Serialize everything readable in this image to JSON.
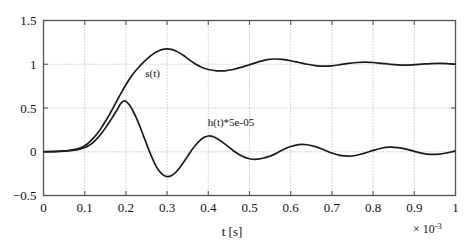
{
  "chart_data": {
    "type": "line",
    "title": "",
    "xlabel": "t [s]",
    "ylabel": "",
    "x_exponent_label": "× 10",
    "x_exponent_power": "-3",
    "xlim": [
      0,
      1
    ],
    "ylim": [
      -0.5,
      1.5
    ],
    "grid": true,
    "grid_style": "dotted",
    "legend_position": "inline-annotations",
    "xticks": [
      0,
      0.1,
      0.2,
      0.3,
      0.4,
      0.5,
      0.6,
      0.7,
      0.8,
      0.9,
      1
    ],
    "xticklabels": [
      "0",
      "0.1",
      "0.2",
      "0.3",
      "0.4",
      "0.5",
      "0.6",
      "0.7",
      "0.8",
      "0.9",
      "1"
    ],
    "yticks": [
      -0.5,
      0,
      0.5,
      1,
      1.5
    ],
    "yticklabels": [
      "−0.5",
      "0",
      "0.5",
      "1",
      "1.5"
    ],
    "annotations": [
      {
        "text": "s(t)",
        "x": 0.265,
        "y": 0.86
      },
      {
        "text": "h(t)*5e-05",
        "x": 0.455,
        "y": 0.3
      }
    ],
    "series": [
      {
        "name": "s(t)",
        "color": "#1a1a1a",
        "x": [
          0,
          0.02,
          0.04,
          0.06,
          0.08,
          0.09,
          0.1,
          0.11,
          0.12,
          0.13,
          0.14,
          0.15,
          0.16,
          0.17,
          0.18,
          0.19,
          0.2,
          0.21,
          0.22,
          0.23,
          0.24,
          0.25,
          0.26,
          0.27,
          0.28,
          0.29,
          0.3,
          0.31,
          0.32,
          0.33,
          0.34,
          0.35,
          0.36,
          0.37,
          0.38,
          0.39,
          0.4,
          0.42,
          0.44,
          0.46,
          0.48,
          0.5,
          0.52,
          0.54,
          0.56,
          0.58,
          0.6,
          0.62,
          0.64,
          0.66,
          0.68,
          0.7,
          0.72,
          0.74,
          0.76,
          0.78,
          0.8,
          0.82,
          0.84,
          0.86,
          0.88,
          0.9,
          0.92,
          0.94,
          0.96,
          0.98,
          1.0
        ],
        "y": [
          0,
          0.002,
          0.006,
          0.014,
          0.03,
          0.045,
          0.07,
          0.105,
          0.15,
          0.205,
          0.27,
          0.345,
          0.425,
          0.51,
          0.6,
          0.685,
          0.765,
          0.84,
          0.905,
          0.96,
          1.01,
          1.055,
          1.095,
          1.13,
          1.155,
          1.17,
          1.175,
          1.17,
          1.155,
          1.13,
          1.1,
          1.065,
          1.03,
          1.0,
          0.975,
          0.955,
          0.94,
          0.925,
          0.925,
          0.94,
          0.965,
          0.995,
          1.025,
          1.05,
          1.06,
          1.055,
          1.04,
          1.02,
          1.0,
          0.985,
          0.978,
          0.982,
          0.995,
          1.01,
          1.02,
          1.025,
          1.02,
          1.01,
          1.0,
          0.992,
          0.99,
          0.995,
          1.002,
          1.008,
          1.01,
          1.008,
          1.0
        ]
      },
      {
        "name": "h(t)*5e-05",
        "color": "#1a1a1a",
        "x": [
          0,
          0.02,
          0.04,
          0.06,
          0.08,
          0.09,
          0.1,
          0.11,
          0.12,
          0.13,
          0.14,
          0.15,
          0.16,
          0.17,
          0.18,
          0.185,
          0.19,
          0.195,
          0.2,
          0.21,
          0.22,
          0.23,
          0.24,
          0.25,
          0.26,
          0.27,
          0.28,
          0.29,
          0.3,
          0.31,
          0.32,
          0.33,
          0.34,
          0.35,
          0.36,
          0.37,
          0.38,
          0.39,
          0.4,
          0.41,
          0.42,
          0.44,
          0.46,
          0.48,
          0.5,
          0.52,
          0.54,
          0.55,
          0.56,
          0.58,
          0.6,
          0.62,
          0.64,
          0.66,
          0.68,
          0.7,
          0.72,
          0.74,
          0.76,
          0.78,
          0.8,
          0.82,
          0.84,
          0.86,
          0.88,
          0.9,
          0.92,
          0.94,
          0.96,
          0.98,
          1.0
        ],
        "y": [
          0,
          0.001,
          0.004,
          0.01,
          0.022,
          0.032,
          0.048,
          0.072,
          0.105,
          0.15,
          0.205,
          0.27,
          0.34,
          0.415,
          0.49,
          0.535,
          0.565,
          0.58,
          0.575,
          0.525,
          0.44,
          0.335,
          0.215,
          0.09,
          -0.03,
          -0.135,
          -0.215,
          -0.265,
          -0.285,
          -0.275,
          -0.24,
          -0.185,
          -0.12,
          -0.05,
          0.02,
          0.08,
          0.13,
          0.165,
          0.18,
          0.175,
          0.155,
          0.09,
          0.015,
          -0.045,
          -0.08,
          -0.085,
          -0.065,
          -0.05,
          -0.03,
          0.02,
          0.06,
          0.082,
          0.08,
          0.058,
          0.022,
          -0.015,
          -0.042,
          -0.05,
          -0.04,
          -0.015,
          0.015,
          0.04,
          0.052,
          0.048,
          0.03,
          0.005,
          -0.018,
          -0.03,
          -0.028,
          -0.012,
          0.01
        ]
      }
    ]
  },
  "figure": {
    "axes_color": "#555555",
    "grid_color": "#9a9a9a",
    "background": "#ffffff"
  }
}
